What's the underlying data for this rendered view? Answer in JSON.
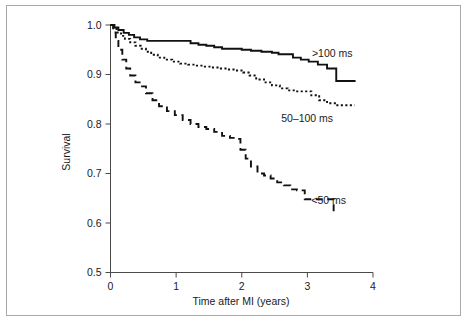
{
  "chart_data": {
    "type": "line",
    "title": "",
    "xlabel": "Time after MI (years)",
    "ylabel": "Survival",
    "xlim": [
      0,
      4
    ],
    "ylim": [
      0.5,
      1.0
    ],
    "xticks": [
      "0",
      "1",
      "2",
      "3",
      "4"
    ],
    "yticks": [
      "0.5",
      "0.6",
      "0.7",
      "0.8",
      "0.9",
      "1.0"
    ],
    "grid": false,
    "legend_position": "inline-annotations",
    "step_type": "post",
    "series": [
      {
        "name": ">100 ms",
        "label": ">100 ms",
        "style": "solid",
        "color": "#111111",
        "annotation_x": 3.07,
        "annotation_y": 0.935,
        "x": [
          0.0,
          0.06,
          0.12,
          0.2,
          0.28,
          0.36,
          0.45,
          0.56,
          0.7,
          0.9,
          1.1,
          1.22,
          1.34,
          1.46,
          1.58,
          1.7,
          1.86,
          2.0,
          2.14,
          2.3,
          2.46,
          2.56,
          2.66,
          2.78,
          2.9,
          3.02,
          3.16,
          3.3,
          3.44,
          3.72
        ],
        "y": [
          1.0,
          0.995,
          0.99,
          0.984,
          0.98,
          0.975,
          0.971,
          0.968,
          0.968,
          0.968,
          0.968,
          0.963,
          0.96,
          0.958,
          0.955,
          0.952,
          0.952,
          0.95,
          0.948,
          0.946,
          0.944,
          0.941,
          0.941,
          0.934,
          0.93,
          0.926,
          0.92,
          0.912,
          0.887,
          0.885
        ]
      },
      {
        "name": "50-100 ms",
        "label": "50–100 ms",
        "style": "dotted",
        "color": "#111111",
        "annotation_x": 2.6,
        "annotation_y": 0.805,
        "x": [
          0.0,
          0.05,
          0.1,
          0.16,
          0.22,
          0.3,
          0.38,
          0.46,
          0.54,
          0.62,
          0.72,
          0.82,
          0.94,
          1.06,
          1.18,
          1.3,
          1.42,
          1.54,
          1.66,
          1.78,
          1.9,
          2.02,
          2.12,
          2.22,
          2.34,
          2.46,
          2.58,
          2.7,
          2.82,
          2.94,
          3.06,
          3.18,
          3.3,
          3.44,
          3.72
        ],
        "y": [
          1.0,
          0.992,
          0.985,
          0.978,
          0.972,
          0.965,
          0.958,
          0.952,
          0.946,
          0.94,
          0.934,
          0.93,
          0.926,
          0.922,
          0.92,
          0.918,
          0.916,
          0.914,
          0.912,
          0.91,
          0.908,
          0.904,
          0.898,
          0.89,
          0.884,
          0.878,
          0.872,
          0.868,
          0.866,
          0.866,
          0.858,
          0.848,
          0.842,
          0.838,
          0.838
        ]
      },
      {
        "name": "<50 ms",
        "label": "<50 ms",
        "style": "dashed",
        "color": "#111111",
        "annotation_x": 3.06,
        "annotation_y": 0.638,
        "x": [
          0.0,
          0.04,
          0.08,
          0.12,
          0.18,
          0.24,
          0.3,
          0.38,
          0.46,
          0.54,
          0.64,
          0.74,
          0.86,
          0.98,
          1.1,
          1.22,
          1.34,
          1.46,
          1.58,
          1.7,
          1.82,
          1.9,
          1.98,
          2.06,
          2.14,
          2.24,
          2.34,
          2.44,
          2.54,
          2.64,
          2.74,
          2.84,
          2.96,
          3.4
        ],
        "y": [
          1.0,
          0.985,
          0.968,
          0.95,
          0.93,
          0.912,
          0.898,
          0.884,
          0.876,
          0.862,
          0.848,
          0.836,
          0.826,
          0.818,
          0.808,
          0.8,
          0.794,
          0.79,
          0.784,
          0.776,
          0.772,
          0.77,
          0.748,
          0.73,
          0.714,
          0.7,
          0.696,
          0.69,
          0.682,
          0.676,
          0.668,
          0.666,
          0.648,
          0.615
        ]
      }
    ]
  }
}
